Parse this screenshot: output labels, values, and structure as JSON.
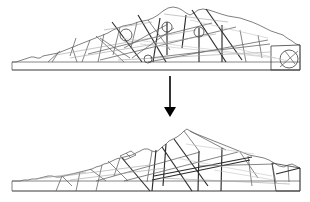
{
  "figure": {
    "type": "diagram",
    "background_color": "#ffffff",
    "width": 310,
    "height": 202,
    "colors": {
      "outline": "#4a4a4a",
      "joint_dark": "#2b2b2b",
      "joint_mid": "#5d5d5d",
      "joint_light": "#9f9f9f",
      "joint_faint": "#c2c2c2",
      "arrow": "#000000"
    },
    "panels": [
      {
        "id": "top-panel",
        "name": "initial-state-section",
        "label": "",
        "bounds": {
          "x": 10,
          "y": 4,
          "width": 292,
          "height": 68
        },
        "ground_band": {
          "x": 12,
          "y": 62,
          "width": 288,
          "height": 8
        },
        "marker_count": 4,
        "markers": [
          {
            "name": "marker-circle-1",
            "cx": 126,
            "cy": 35,
            "r": 6
          },
          {
            "name": "marker-circle-2",
            "cx": 167,
            "cy": 27,
            "r": 5
          },
          {
            "name": "marker-circle-3",
            "cx": 199,
            "cy": 32,
            "r": 5
          },
          {
            "name": "marker-circle-4",
            "cx": 148,
            "cy": 59,
            "r": 4
          },
          {
            "name": "marker-circle-5",
            "cx": 289,
            "cy": 59,
            "r": 9
          }
        ]
      },
      {
        "id": "bottom-panel",
        "name": "failed-state-section",
        "label": "",
        "bounds": {
          "x": 10,
          "y": 128,
          "width": 292,
          "height": 64
        },
        "ground_band": {
          "x": 12,
          "y": 181,
          "width": 288,
          "height": 10
        },
        "marker_count": 0,
        "markers": []
      }
    ],
    "arrow": {
      "name": "process-arrow",
      "direction": "down",
      "x": 170,
      "y_start": 76,
      "y_end": 116,
      "label": ""
    }
  }
}
